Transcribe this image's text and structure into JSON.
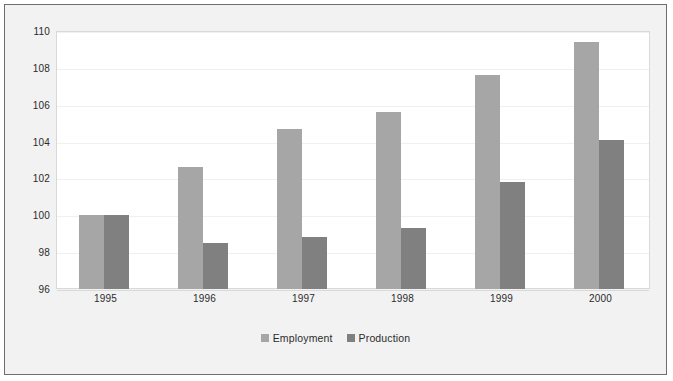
{
  "chart_data": {
    "type": "bar",
    "title": "",
    "subtitle": "",
    "xlabel": "",
    "ylabel": "",
    "categories": [
      "1995",
      "1996",
      "1997",
      "1998",
      "1999",
      "2000"
    ],
    "series": [
      {
        "name": "Employment",
        "color": "#a6a6a6",
        "values": [
          100.0,
          102.6,
          104.7,
          105.6,
          107.6,
          109.4
        ]
      },
      {
        "name": "Production",
        "color": "#808080",
        "values": [
          100.0,
          98.5,
          98.8,
          99.3,
          101.8,
          104.1
        ]
      }
    ],
    "ylim": [
      96,
      110
    ],
    "yticks": [
      96,
      98,
      100,
      102,
      104,
      106,
      108,
      110
    ],
    "ytick_labels": [
      "96",
      "98",
      "100",
      "102",
      "104",
      "106",
      "108",
      "110"
    ],
    "grid": true,
    "legend_position": "bottom"
  },
  "legend": {
    "items": [
      {
        "label": "Employment"
      },
      {
        "label": "Production"
      }
    ]
  },
  "colors": {
    "series_employment": "#a6a6a6",
    "series_production": "#808080",
    "figure_background": "#f2f2f2",
    "plot_background": "#ffffff",
    "frame_border": "#6e6e6e",
    "gridline": "#f0f0f0",
    "text": "#2b2b2b"
  }
}
